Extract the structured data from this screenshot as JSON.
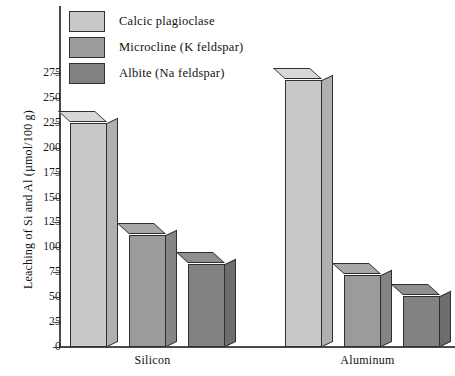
{
  "chart_data": {
    "type": "bar",
    "title": "",
    "xlabel": "",
    "ylabel": "Leaching of Si and Al (µmol/100 g)",
    "categories": [
      "Silicon",
      "Aluminum"
    ],
    "ylim": [
      0,
      275
    ],
    "yticks": [
      0,
      25,
      50,
      75,
      100,
      125,
      150,
      175,
      200,
      225,
      250,
      275
    ],
    "ytick_labels": [
      "0",
      "25",
      "50",
      "75",
      "100",
      "125",
      "150",
      "175",
      "200",
      "225",
      "250",
      "275"
    ],
    "grid": false,
    "legend_position": "top-left",
    "style": "3d-bars",
    "series": [
      {
        "name": "Calcic plagioclase",
        "color": "#c9c9c9",
        "side_color": "#b0b0b0",
        "top_color": "#d8d8d8",
        "values": [
          225,
          268
        ]
      },
      {
        "name": "Microcline (K feldspar)",
        "color": "#9b9b9b",
        "side_color": "#858585",
        "top_color": "#a8a8a8",
        "values": [
          112,
          72
        ]
      },
      {
        "name": "Albite (Na feldspar)",
        "color": "#828282",
        "side_color": "#6d6d6d",
        "top_color": "#8f8f8f",
        "values": [
          83,
          51
        ]
      }
    ]
  },
  "axis": {
    "y_title": "Leaching of Si and Al (µmol/100 g)",
    "tick_labels": [
      "275",
      "250",
      "225",
      "200",
      "175",
      "150",
      "125",
      "100",
      "75",
      "50",
      "25",
      "0"
    ],
    "group_labels": [
      "Silicon",
      "Aluminum"
    ]
  },
  "legend": {
    "items": [
      {
        "label": "Calcic plagioclase",
        "color": "#c9c9c9"
      },
      {
        "label": "Microcline (K feldspar)",
        "color": "#9b9b9b"
      },
      {
        "label": "Albite (Na feldspar)",
        "color": "#828282"
      }
    ]
  },
  "colors": {
    "axis": "#4a4a4a",
    "outline": "#2f2f2f",
    "text": "#111111",
    "background": "#ffffff"
  }
}
